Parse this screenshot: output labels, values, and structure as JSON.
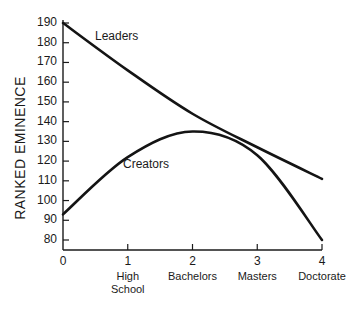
{
  "chart_data": {
    "type": "line",
    "title": "",
    "xlabel": "",
    "ylabel": "RANKED EMINENCE",
    "x": [
      0,
      1,
      2,
      3,
      4
    ],
    "x_tick_labels": [
      "0",
      "1",
      "2",
      "3",
      "4"
    ],
    "x_category_labels": [
      "",
      "High\nSchool",
      "Bachelors",
      "Masters",
      "Doctorate"
    ],
    "y_ticks": [
      80,
      90,
      100,
      110,
      120,
      130,
      140,
      150,
      160,
      170,
      180,
      190
    ],
    "ylim": [
      75,
      190
    ],
    "xlim": [
      0,
      4
    ],
    "grid": false,
    "legend": "inline labels",
    "series": [
      {
        "name": "Leaders",
        "values": [
          190,
          166,
          144,
          127,
          111
        ]
      },
      {
        "name": "Creators",
        "values": [
          93,
          122,
          135,
          123,
          80
        ]
      }
    ],
    "annotations": [
      {
        "text": "Leaders",
        "x": 0.45,
        "y": 183
      },
      {
        "text": "Creators",
        "x": 1.0,
        "y": 116
      }
    ]
  },
  "labels": {
    "ylabel": "RANKED EMINENCE",
    "leaders": "Leaders",
    "creators": "Creators"
  }
}
